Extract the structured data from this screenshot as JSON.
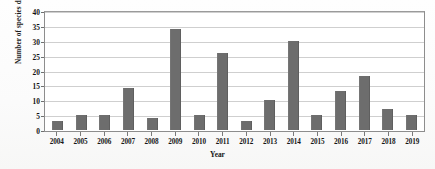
{
  "chart_data": {
    "type": "bar",
    "title": "",
    "xlabel": "Year",
    "ylabel": "Number of species described",
    "categories": [
      "2004",
      "2005",
      "2006",
      "2007",
      "2008",
      "2009",
      "2010",
      "2011",
      "2012",
      "2013",
      "2014",
      "2015",
      "2016",
      "2017",
      "2018",
      "2019"
    ],
    "values": [
      3,
      5,
      5,
      14,
      4,
      34,
      5,
      26,
      3,
      10,
      30,
      5,
      13,
      18,
      7,
      5
    ],
    "ylim": [
      0,
      40
    ],
    "yticks": [
      0,
      5,
      10,
      15,
      20,
      25,
      30,
      35,
      40
    ],
    "ytick_labels": [
      "0",
      "5",
      "10",
      "15",
      "20",
      "25",
      "30",
      "35",
      "40"
    ],
    "grid": true,
    "legend": false,
    "legend_position": "none",
    "bar_color": "#6d6d6d",
    "gridline_color": "#cfcfcf",
    "axis_color": "#8d8d8d",
    "background_color": "#ffffff"
  }
}
